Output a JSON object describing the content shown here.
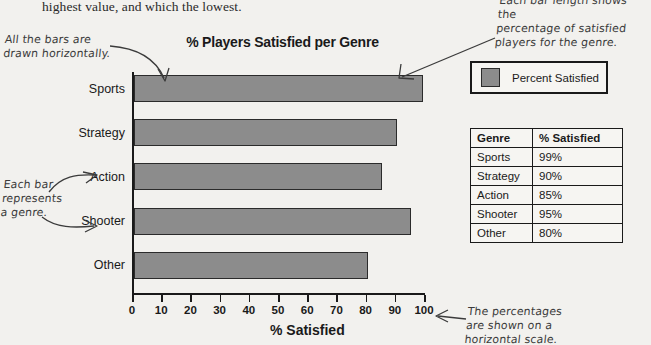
{
  "book_text": "highest value, and which the lowest.",
  "chart": {
    "title": "% Players Satisfied per Genre",
    "xaxis_title": "% Satisfied"
  },
  "legend": {
    "label": "Percent Satisfied",
    "swatch_color": "#8c8c8c"
  },
  "table": {
    "headers": [
      "Genre",
      "% Satisfied"
    ],
    "rows": [
      [
        "Sports",
        "99%"
      ],
      [
        "Strategy",
        "90%"
      ],
      [
        "Action",
        "85%"
      ],
      [
        "Shooter",
        "95%"
      ],
      [
        "Other",
        "80%"
      ]
    ]
  },
  "annotations": {
    "bars_horizontal": "All the bars are\ndrawn horizontally.",
    "bar_length": "Each bar length shows the\npercentage of satisfied\nplayers for the genre.",
    "each_bar_genre": "Each bar\nrepresents\na genre.",
    "horizontal_scale": "The percentages\nare shown on a\nhorizontal scale."
  },
  "chart_data": {
    "type": "bar",
    "orientation": "horizontal",
    "title": "% Players Satisfied per Genre",
    "categories": [
      "Sports",
      "Strategy",
      "Action",
      "Shooter",
      "Other"
    ],
    "values": [
      99,
      90,
      85,
      95,
      80
    ],
    "series": [
      {
        "name": "Percent Satisfied",
        "values": [
          99,
          90,
          85,
          95,
          80
        ]
      }
    ],
    "xlabel": "% Satisfied",
    "ylabel": "",
    "xlim": [
      0,
      100
    ],
    "xticks": [
      0,
      10,
      20,
      30,
      40,
      50,
      60,
      70,
      80,
      90,
      100
    ],
    "grid": false,
    "legend": "top-right",
    "bar_color": "#8c8c8c"
  }
}
